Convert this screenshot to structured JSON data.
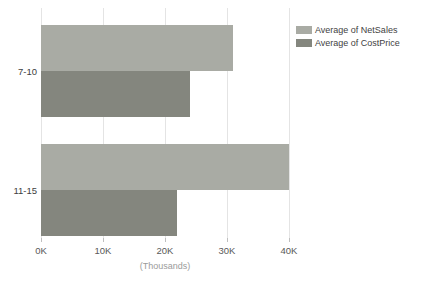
{
  "chart_data": {
    "type": "bar",
    "orientation": "horizontal",
    "title": "",
    "categories": [
      "7-10",
      "11-15"
    ],
    "series": [
      {
        "name": "Average of NetSales",
        "color": "#a9aba4",
        "values": [
          31000,
          40000
        ]
      },
      {
        "name": "Average of CostPrice",
        "color": "#84867e",
        "values": [
          24000,
          22000
        ]
      }
    ],
    "xlabel": "(Thousands)",
    "x_ticks": [
      {
        "value": 0,
        "label": "0K"
      },
      {
        "value": 10000,
        "label": "10K"
      },
      {
        "value": 20000,
        "label": "20K"
      },
      {
        "value": 30000,
        "label": "30K"
      },
      {
        "value": 40000,
        "label": "40K"
      }
    ],
    "xlim": [
      0,
      40000
    ],
    "grid": true,
    "legend_position": "top-right"
  },
  "colors": {
    "background": "#ffffff",
    "gridline": "#e4e4e4",
    "tick_mark": "#bfbfbf",
    "axis_text": "#595959",
    "category_text": "#404040",
    "legend_text": "#3f3f3f",
    "axis_title_text": "#9b9b9b"
  }
}
